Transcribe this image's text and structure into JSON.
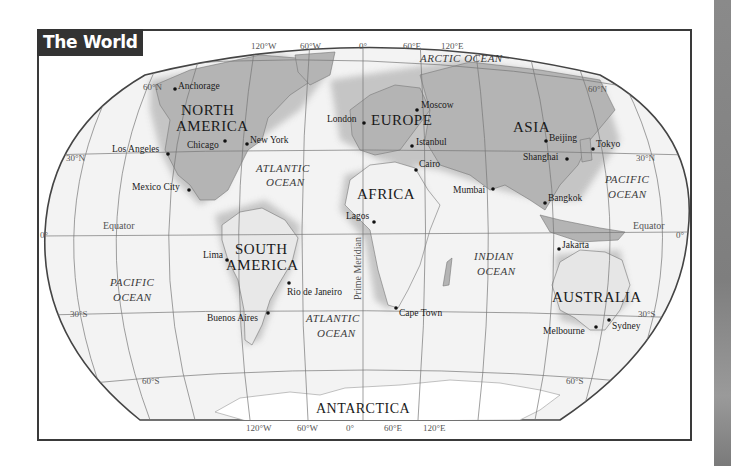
{
  "title": "The World",
  "map": {
    "projection_outline_colors": {
      "frame": "#3a3a3a",
      "title_bg": "#333333",
      "land": "#a8a8a8",
      "ocean": "#f2f2f2",
      "antarctica": "#ffffff"
    },
    "continents": [
      {
        "id": "north-america",
        "lines": [
          "NORTH",
          "AMERICA"
        ]
      },
      {
        "id": "south-america",
        "lines": [
          "SOUTH",
          "AMERICA"
        ]
      },
      {
        "id": "europe",
        "lines": [
          "EUROPE"
        ]
      },
      {
        "id": "africa",
        "lines": [
          "AFRICA"
        ]
      },
      {
        "id": "asia",
        "lines": [
          "ASIA"
        ]
      },
      {
        "id": "australia",
        "lines": [
          "AUSTRALIA"
        ]
      },
      {
        "id": "antarctica",
        "lines": [
          "ANTARCTICA"
        ]
      }
    ],
    "oceans": [
      {
        "id": "arctic",
        "lines": [
          "ARCTIC OCEAN"
        ]
      },
      {
        "id": "atlantic-north",
        "lines": [
          "ATLANTIC",
          "OCEAN"
        ]
      },
      {
        "id": "atlantic-south",
        "lines": [
          "ATLANTIC",
          "OCEAN"
        ]
      },
      {
        "id": "pacific-west",
        "lines": [
          "PACIFIC",
          "OCEAN"
        ]
      },
      {
        "id": "pacific-east",
        "lines": [
          "PACIFIC",
          "OCEAN"
        ]
      },
      {
        "id": "indian",
        "lines": [
          "INDIAN",
          "OCEAN"
        ]
      }
    ],
    "cities": [
      "Anchorage",
      "Los Angeles",
      "Chicago",
      "New York",
      "Mexico City",
      "Lima",
      "Rio de Janeiro",
      "Buenos Aires",
      "London",
      "Moscow",
      "Istanbul",
      "Cairo",
      "Lagos",
      "Cape Town",
      "Mumbai",
      "Beijing",
      "Shanghai",
      "Tokyo",
      "Bangkok",
      "Jakarta",
      "Melbourne",
      "Sydney"
    ],
    "lines": {
      "prime_meridian": "Prime Meridian",
      "equator": "Equator"
    },
    "grid_labels": {
      "top_longitudes": [
        "120°W",
        "60°W",
        "0°",
        "60°E",
        "120°E"
      ],
      "bottom_longitudes": [
        "120°W",
        "60°W",
        "0°",
        "60°E",
        "120°E"
      ],
      "lat_60n": "60°N",
      "lat_30n": "30°N",
      "lat_0": "0°",
      "lat_30s": "30°S",
      "lat_60s": "60°S"
    }
  }
}
